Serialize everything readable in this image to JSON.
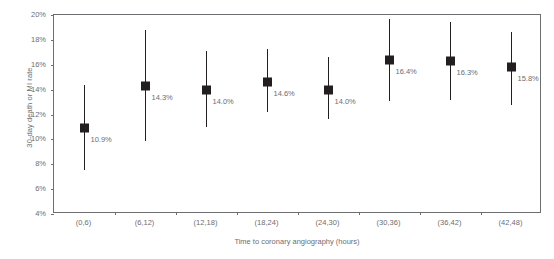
{
  "chart_data": {
    "type": "scatter",
    "title": "",
    "xlabel": "Time to coronary angiography (hours)",
    "ylabel": "30-day death or MI rate",
    "categories": [
      "(0,6)",
      "(6,12)",
      "(12,18)",
      "(18,24)",
      "(24,30)",
      "(30,36)",
      "(36,42)",
      "(42,48)"
    ],
    "values": [
      10.9,
      14.3,
      14.0,
      14.6,
      14.0,
      16.4,
      16.3,
      15.8
    ],
    "data_labels": [
      "10.9%",
      "14.3%",
      "14.0%",
      "14.6%",
      "14.0%",
      "16.4%",
      "16.3%",
      "15.8%"
    ],
    "error_low": [
      7.5,
      9.9,
      11.0,
      12.2,
      11.6,
      13.1,
      13.2,
      12.8
    ],
    "error_high": [
      14.4,
      18.8,
      17.1,
      17.3,
      16.6,
      19.7,
      19.4,
      18.6
    ],
    "ylim": [
      4,
      20
    ],
    "ytick_labels": [
      "20%",
      "18%",
      "16%",
      "14%",
      "12%",
      "10%",
      "8%",
      "6%",
      "4%"
    ],
    "ytick_values": [
      20,
      18,
      16,
      14,
      12,
      10,
      8,
      6,
      4
    ],
    "ytick_suffix": "%",
    "grid": false,
    "legend": "none",
    "marker_color": "#231f20",
    "axis_color": "#6d6e71",
    "text_color": "#6d6e71"
  }
}
